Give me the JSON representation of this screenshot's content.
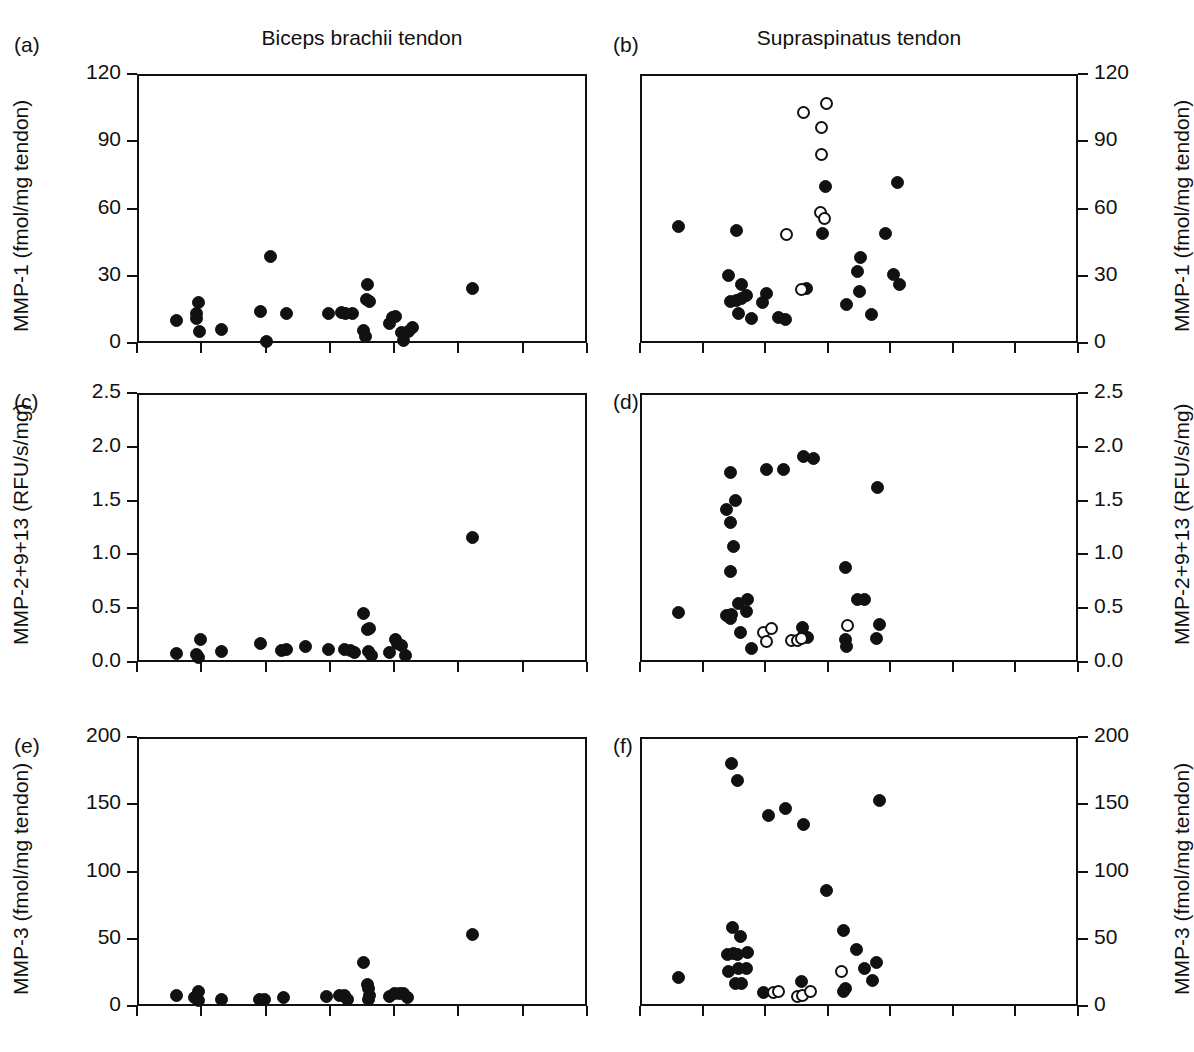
{
  "figure": {
    "column_titles": [
      "Biceps brachii tendon",
      "Supraspinatus tendon"
    ],
    "panel_tags": [
      "(a)",
      "(b)",
      "(c)",
      "(d)",
      "(e)",
      "(f)"
    ],
    "marker_legend": {
      "filled_label": "filled-circle",
      "open_label": "open-circle",
      "color": "#111111"
    }
  },
  "chart_data": [
    {
      "type": "scatter",
      "panel": "(a)",
      "title": "Biceps brachii tendon",
      "ylabel": "MMP-1 (fmol/mg tendon)",
      "xlabel": "",
      "ylim": [
        0,
        120
      ],
      "yticks": [
        0,
        30,
        60,
        90,
        120
      ],
      "ytick_labels": [
        "0",
        "30",
        "60",
        "90",
        "120"
      ],
      "xlim": [
        0,
        7
      ],
      "xticks": [
        0,
        1,
        2,
        3,
        4,
        5,
        6,
        7
      ],
      "xtick_labels": [
        "",
        "",
        "",
        "",
        "",
        "",
        "",
        ""
      ],
      "axis_side": "left",
      "grid": false,
      "series": [
        {
          "name": "filled-circle",
          "marker": "filled",
          "points": [
            [
              0.62,
              10.0
            ],
            [
              0.92,
              13.0
            ],
            [
              0.92,
              11.0
            ],
            [
              0.95,
              18.0
            ],
            [
              0.97,
              5.0
            ],
            [
              1.32,
              6.0
            ],
            [
              1.92,
              14.0
            ],
            [
              2.02,
              0.5
            ],
            [
              2.33,
              13.0
            ],
            [
              2.98,
              13.0
            ],
            [
              3.18,
              13.5
            ],
            [
              3.25,
              13.0
            ],
            [
              3.35,
              13.0
            ],
            [
              3.58,
              26.0
            ],
            [
              3.57,
              19.5
            ],
            [
              3.62,
              18.5
            ],
            [
              3.52,
              5.5
            ],
            [
              3.55,
              3.0
            ],
            [
              3.97,
              11.5
            ],
            [
              3.92,
              8.5
            ],
            [
              4.02,
              12.0
            ],
            [
              4.12,
              4.5
            ],
            [
              4.15,
              1.0
            ],
            [
              4.22,
              5.0
            ],
            [
              4.28,
              7.0
            ],
            [
              2.08,
              38.5
            ],
            [
              5.22,
              24.5
            ]
          ]
        }
      ]
    },
    {
      "type": "scatter",
      "panel": "(b)",
      "title": "Supraspinatus tendon",
      "ylabel": "MMP-1 (fmol/mg tendon)",
      "xlabel": "",
      "ylim": [
        0,
        120
      ],
      "yticks": [
        0,
        30,
        60,
        90,
        120
      ],
      "ytick_labels": [
        "0",
        "30",
        "60",
        "90",
        "120"
      ],
      "xlim": [
        0,
        7
      ],
      "xticks": [
        0,
        1,
        2,
        3,
        4,
        5,
        6,
        7
      ],
      "xtick_labels": [
        "",
        "",
        "",
        "",
        "",
        "",
        "",
        ""
      ],
      "axis_side": "right",
      "grid": false,
      "series": [
        {
          "name": "filled-circle",
          "marker": "filled",
          "points": [
            [
              0.62,
              52.0
            ],
            [
              1.55,
              50.0
            ],
            [
              1.42,
              30.0
            ],
            [
              1.62,
              26.0
            ],
            [
              1.44,
              18.5
            ],
            [
              1.55,
              19.0
            ],
            [
              1.62,
              20.0
            ],
            [
              1.7,
              21.0
            ],
            [
              1.58,
              13.0
            ],
            [
              1.78,
              11.0
            ],
            [
              2.02,
              22.0
            ],
            [
              1.95,
              18.0
            ],
            [
              2.22,
              11.5
            ],
            [
              2.32,
              10.5
            ],
            [
              2.66,
              24.5
            ],
            [
              2.96,
              70.0
            ],
            [
              2.92,
              49.0
            ],
            [
              3.3,
              17.0
            ],
            [
              3.52,
              38.0
            ],
            [
              3.48,
              32.0
            ],
            [
              3.5,
              23.0
            ],
            [
              3.7,
              12.5
            ],
            [
              3.92,
              49.0
            ],
            [
              4.05,
              30.5
            ],
            [
              4.15,
              26.0
            ],
            [
              4.12,
              71.5
            ]
          ]
        },
        {
          "name": "open-circle",
          "marker": "open",
          "points": [
            [
              2.62,
              103.0
            ],
            [
              2.98,
              107.0
            ],
            [
              2.9,
              96.0
            ],
            [
              2.9,
              84.0
            ],
            [
              2.88,
              58.0
            ],
            [
              2.95,
              55.5
            ],
            [
              2.58,
              24.0
            ],
            [
              2.34,
              48.5
            ]
          ]
        }
      ]
    },
    {
      "type": "scatter",
      "panel": "(c)",
      "title": "",
      "ylabel": "MMP-2+9+13 (RFU/s/mg)",
      "xlabel": "",
      "ylim": [
        0.0,
        2.5
      ],
      "yticks": [
        0.0,
        0.5,
        1.0,
        1.5,
        2.0,
        2.5
      ],
      "ytick_labels": [
        "0.0",
        "0.5",
        "1.0",
        "1.5",
        "2.0",
        "2.5"
      ],
      "xlim": [
        0,
        7
      ],
      "xticks": [
        0,
        1,
        2,
        3,
        4,
        5,
        6,
        7
      ],
      "xtick_labels": [
        "",
        "",
        "",
        "",
        "",
        "",
        "",
        ""
      ],
      "axis_side": "left",
      "grid": false,
      "series": [
        {
          "name": "filled-circle",
          "marker": "filled",
          "points": [
            [
              0.62,
              0.08
            ],
            [
              0.92,
              0.07
            ],
            [
              0.95,
              0.04
            ],
            [
              0.98,
              0.21
            ],
            [
              1.32,
              0.1
            ],
            [
              1.92,
              0.17
            ],
            [
              2.25,
              0.11
            ],
            [
              2.33,
              0.12
            ],
            [
              2.62,
              0.14
            ],
            [
              2.98,
              0.12
            ],
            [
              3.22,
              0.12
            ],
            [
              3.32,
              0.11
            ],
            [
              3.38,
              0.09
            ],
            [
              3.52,
              0.45
            ],
            [
              3.58,
              0.3
            ],
            [
              3.62,
              0.31
            ],
            [
              3.6,
              0.1
            ],
            [
              3.65,
              0.06
            ],
            [
              3.92,
              0.09
            ],
            [
              4.02,
              0.21
            ],
            [
              4.05,
              0.17
            ],
            [
              4.12,
              0.15
            ],
            [
              4.18,
              0.06
            ],
            [
              5.22,
              1.16
            ]
          ]
        }
      ]
    },
    {
      "type": "scatter",
      "panel": "(d)",
      "title": "",
      "ylabel": "MMP-2+9+13 (RFU/s/mg)",
      "xlabel": "",
      "ylim": [
        0.0,
        2.5
      ],
      "yticks": [
        0.0,
        0.5,
        1.0,
        1.5,
        2.0,
        2.5
      ],
      "ytick_labels": [
        "0.0",
        "0.5",
        "1.0",
        "1.5",
        "2.0",
        "2.5"
      ],
      "xlim": [
        0,
        7
      ],
      "xticks": [
        0,
        1,
        2,
        3,
        4,
        5,
        6,
        7
      ],
      "xtick_labels": [
        "",
        "",
        "",
        "",
        "",
        "",
        "",
        ""
      ],
      "axis_side": "right",
      "grid": false,
      "series": [
        {
          "name": "filled-circle",
          "marker": "filled",
          "points": [
            [
              0.62,
              0.46
            ],
            [
              1.45,
              1.76
            ],
            [
              1.52,
              1.5
            ],
            [
              1.38,
              1.42
            ],
            [
              1.45,
              1.3
            ],
            [
              1.5,
              1.07
            ],
            [
              1.44,
              0.84
            ],
            [
              1.38,
              0.43
            ],
            [
              1.46,
              0.44
            ],
            [
              1.45,
              0.4
            ],
            [
              1.58,
              0.54
            ],
            [
              1.72,
              0.58
            ],
            [
              1.7,
              0.47
            ],
            [
              1.6,
              0.27
            ],
            [
              1.78,
              0.13
            ],
            [
              2.02,
              1.79
            ],
            [
              2.3,
              1.79
            ],
            [
              2.62,
              1.91
            ],
            [
              2.78,
              1.89
            ],
            [
              2.6,
              0.32
            ],
            [
              2.62,
              0.25
            ],
            [
              2.68,
              0.23
            ],
            [
              3.28,
              0.88
            ],
            [
              3.28,
              0.21
            ],
            [
              3.3,
              0.14
            ],
            [
              3.48,
              0.58
            ],
            [
              3.58,
              0.58
            ],
            [
              3.8,
              1.62
            ],
            [
              3.82,
              0.35
            ],
            [
              3.78,
              0.22
            ]
          ]
        },
        {
          "name": "open-circle",
          "marker": "open",
          "points": [
            [
              1.98,
              0.27
            ],
            [
              2.1,
              0.31
            ],
            [
              2.02,
              0.19
            ],
            [
              2.42,
              0.2
            ],
            [
              2.52,
              0.2
            ],
            [
              2.58,
              0.22
            ],
            [
              3.32,
              0.34
            ]
          ]
        }
      ]
    },
    {
      "type": "scatter",
      "panel": "(e)",
      "title": "",
      "ylabel": "MMP-3 (fmol/mg tendon)",
      "xlabel": "",
      "ylim": [
        0,
        200
      ],
      "yticks": [
        0,
        50,
        100,
        150,
        200
      ],
      "ytick_labels": [
        "0",
        "50",
        "100",
        "150",
        "200"
      ],
      "xlim": [
        0,
        7
      ],
      "xticks": [
        0,
        1,
        2,
        3,
        4,
        5,
        6,
        7
      ],
      "xtick_labels": [
        "",
        "",
        "",
        "",
        "",
        "",
        "",
        ""
      ],
      "axis_side": "left",
      "grid": false,
      "series": [
        {
          "name": "filled-circle",
          "marker": "filled",
          "points": [
            [
              0.62,
              8.0
            ],
            [
              0.9,
              6.0
            ],
            [
              0.95,
              11.0
            ],
            [
              0.96,
              4.0
            ],
            [
              1.32,
              5.0
            ],
            [
              1.9,
              5.0
            ],
            [
              1.99,
              5.0
            ],
            [
              2.28,
              6.0
            ],
            [
              2.95,
              7.0
            ],
            [
              3.15,
              8.0
            ],
            [
              3.22,
              8.0
            ],
            [
              3.28,
              5.0
            ],
            [
              3.52,
              32.0
            ],
            [
              3.58,
              16.0
            ],
            [
              3.6,
              13.0
            ],
            [
              3.62,
              8.0
            ],
            [
              3.6,
              5.0
            ],
            [
              3.92,
              7.0
            ],
            [
              4.0,
              9.0
            ],
            [
              4.08,
              9.0
            ],
            [
              4.14,
              9.0
            ],
            [
              4.2,
              6.0
            ],
            [
              5.22,
              53.0
            ]
          ]
        }
      ]
    },
    {
      "type": "scatter",
      "panel": "(f)",
      "title": "",
      "ylabel": "MMP-3 (fmol/mg tendon)",
      "xlabel": "",
      "ylim": [
        0,
        200
      ],
      "yticks": [
        0,
        50,
        100,
        150,
        200
      ],
      "ytick_labels": [
        "0",
        "50",
        "100",
        "150",
        "200"
      ],
      "xlim": [
        0,
        7
      ],
      "xticks": [
        0,
        1,
        2,
        3,
        4,
        5,
        6,
        7
      ],
      "xtick_labels": [
        "",
        "",
        "",
        "",
        "",
        "",
        "",
        ""
      ],
      "axis_side": "right",
      "grid": false,
      "series": [
        {
          "name": "filled-circle",
          "marker": "filled",
          "points": [
            [
              0.62,
              21.0
            ],
            [
              1.46,
              180.0
            ],
            [
              1.56,
              168.0
            ],
            [
              1.48,
              58.0
            ],
            [
              1.6,
              52.0
            ],
            [
              1.4,
              38.0
            ],
            [
              1.5,
              39.0
            ],
            [
              1.56,
              38.0
            ],
            [
              1.42,
              26.0
            ],
            [
              1.58,
              28.0
            ],
            [
              1.7,
              28.0
            ],
            [
              1.72,
              40.0
            ],
            [
              1.52,
              17.0
            ],
            [
              1.62,
              17.0
            ],
            [
              1.98,
              10.0
            ],
            [
              2.06,
              142.0
            ],
            [
              2.32,
              147.0
            ],
            [
              2.62,
              135.0
            ],
            [
              2.58,
              18.0
            ],
            [
              2.98,
              86.0
            ],
            [
              3.26,
              56.0
            ],
            [
              3.28,
              13.0
            ],
            [
              3.26,
              11.0
            ],
            [
              3.46,
              42.0
            ],
            [
              3.58,
              28.0
            ],
            [
              3.78,
              32.0
            ],
            [
              3.72,
              19.0
            ],
            [
              3.82,
              153.0
            ]
          ]
        },
        {
          "name": "open-circle",
          "marker": "open",
          "points": [
            [
              2.14,
              10.0
            ],
            [
              2.22,
              11.0
            ],
            [
              2.52,
              7.0
            ],
            [
              2.6,
              8.0
            ],
            [
              2.72,
              11.0
            ],
            [
              3.22,
              26.0
            ]
          ]
        }
      ]
    }
  ]
}
